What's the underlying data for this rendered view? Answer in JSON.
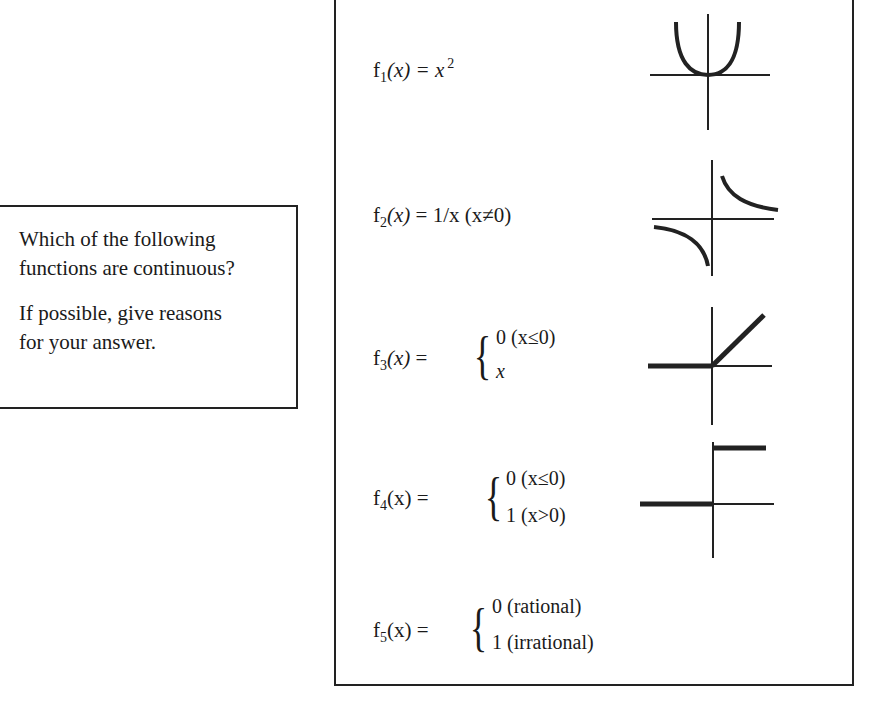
{
  "question": {
    "line1": "Which of the following",
    "line2": "functions are continuous?",
    "line3": "If possible, give reasons",
    "line4": "for your answer."
  },
  "functions": [
    {
      "name": "f",
      "index": "1",
      "arg": "(x)",
      "rhs": "= x",
      "power": "2",
      "graph": "parabola-graph"
    },
    {
      "name": "f",
      "index": "2",
      "arg": "(x)",
      "rhs": "= 1/x (x≠0)",
      "graph": "hyperbola-graph"
    },
    {
      "name": "f",
      "index": "3",
      "arg": "(x)",
      "rhs": "=",
      "cases": [
        "0 (x≤0)",
        "x"
      ],
      "graph": "ramp-graph"
    },
    {
      "name": "f",
      "index": "4",
      "arg": "(x)",
      "rhs": "=",
      "cases": [
        "0 (x≤0)",
        "1 (x>0)"
      ],
      "graph": "step-graph"
    },
    {
      "name": "f",
      "index": "5",
      "arg": "(x)",
      "rhs": "=",
      "cases": [
        "0 (rational)",
        "1 (irrational)"
      ]
    }
  ],
  "brace": "{"
}
